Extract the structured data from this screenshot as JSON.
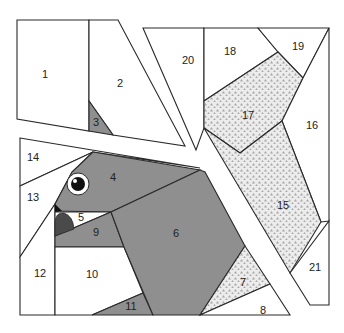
{
  "colors": {
    "background": "#ffffff",
    "outline": "#2a2a2a",
    "white_fabric": "#ffffff",
    "gray_fabric": "#8f8f8f",
    "dark_fabric": "#4a4a4a",
    "black_fabric": "#111111",
    "dotted_fabric_bg": "#e9e9e9",
    "dotted_fabric_dot": "#a9a9a9"
  },
  "pieces": [
    {
      "id": "1",
      "label": "1",
      "fill": "white"
    },
    {
      "id": "2",
      "label": "2",
      "fill": "white"
    },
    {
      "id": "3",
      "label": "3",
      "fill": "gray"
    },
    {
      "id": "4",
      "label": "4",
      "fill": "gray"
    },
    {
      "id": "5",
      "label": "5",
      "fill": "white"
    },
    {
      "id": "6",
      "label": "6",
      "fill": "gray"
    },
    {
      "id": "7",
      "label": "7",
      "fill": "dotted"
    },
    {
      "id": "8",
      "label": "8",
      "fill": "white"
    },
    {
      "id": "9",
      "label": "9",
      "fill": "gray"
    },
    {
      "id": "10",
      "label": "10",
      "fill": "white"
    },
    {
      "id": "11",
      "label": "11",
      "fill": "gray"
    },
    {
      "id": "12",
      "label": "12",
      "fill": "white"
    },
    {
      "id": "13",
      "label": "13",
      "fill": "white"
    },
    {
      "id": "14",
      "label": "14",
      "fill": "white"
    },
    {
      "id": "15",
      "label": "15",
      "fill": "dotted"
    },
    {
      "id": "16",
      "label": "16",
      "fill": "white"
    },
    {
      "id": "17",
      "label": "17",
      "fill": "dotted"
    },
    {
      "id": "18",
      "label": "18",
      "fill": "white"
    },
    {
      "id": "19",
      "label": "19",
      "fill": "white"
    },
    {
      "id": "20",
      "label": "20",
      "fill": "white"
    },
    {
      "id": "21",
      "label": "21",
      "fill": "white"
    }
  ],
  "details": {
    "eye": "eye-icon",
    "beak": "beak-shape"
  }
}
